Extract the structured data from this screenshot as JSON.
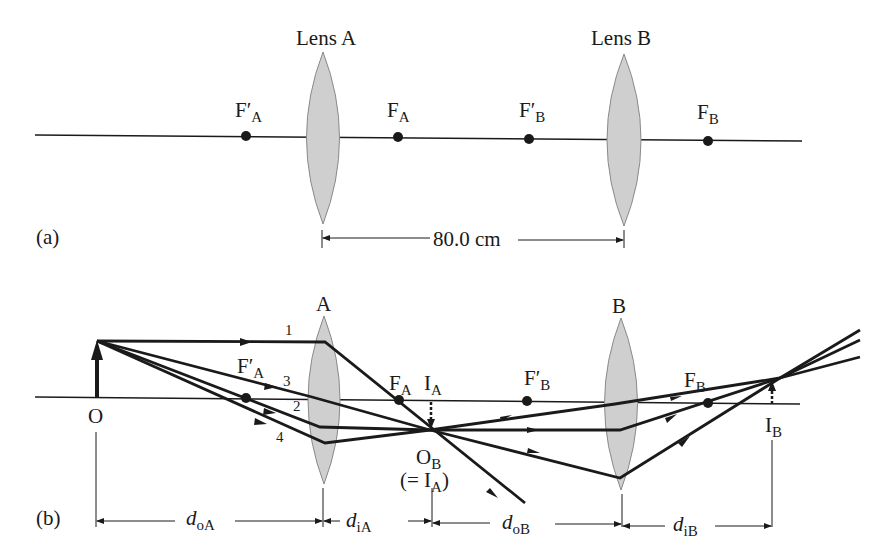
{
  "panel_a": {
    "tag": "(a)",
    "lens_a_label": "Lens A",
    "lens_b_label": "Lens B",
    "points": [
      {
        "main": "F′",
        "sub": "A"
      },
      {
        "main": "F",
        "sub": "A"
      },
      {
        "main": "F′",
        "sub": "B"
      },
      {
        "main": "F",
        "sub": "B"
      }
    ],
    "separation": "80.0 cm"
  },
  "panel_b": {
    "tag": "(b)",
    "lens_a_label": "A",
    "lens_b_label": "B",
    "object_label": "O",
    "ray_numbers": [
      "1",
      "2",
      "3",
      "4"
    ],
    "points": [
      {
        "main": "F′",
        "sub": "A"
      },
      {
        "main": "F",
        "sub": "A"
      },
      {
        "main": "I",
        "sub": "A"
      },
      {
        "main": "F′",
        "sub": "B"
      },
      {
        "main": "F",
        "sub": "B"
      },
      {
        "main": "I",
        "sub": "B"
      }
    ],
    "ob_label": {
      "main": "O",
      "sub": "B"
    },
    "ob_note": {
      "open": "(= I",
      "sub": "A",
      "close": ")"
    },
    "distances": [
      {
        "main": "d",
        "sub": "oA"
      },
      {
        "main": "d",
        "sub": "iA"
      },
      {
        "main": "d",
        "sub": "oB"
      },
      {
        "main": "d",
        "sub": "iB"
      }
    ]
  },
  "colors": {
    "lens_fill": "#cfcfcf",
    "lens_stroke": "#8a8a8a",
    "line": "#1a1a1a"
  }
}
